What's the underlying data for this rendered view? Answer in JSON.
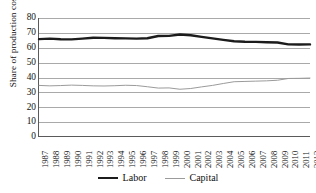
{
  "chart_data": {
    "type": "line",
    "title": "",
    "xlabel": "",
    "ylabel": "Share of production costs (%)",
    "ylim": [
      0,
      80
    ],
    "ytick_step": 10,
    "yticks": [
      80,
      70,
      60,
      50,
      40,
      30,
      20,
      10,
      0
    ],
    "grid": true,
    "legend_position": "bottom",
    "categories": [
      "1987",
      "1988",
      "1989",
      "1990",
      "1991",
      "1992",
      "1993",
      "1994",
      "1995",
      "1996",
      "1997",
      "1998",
      "1999",
      "2000",
      "2001",
      "2002",
      "2003",
      "2004",
      "2005",
      "2006",
      "2007",
      "2008",
      "2009",
      "2010",
      "2011",
      "2012"
    ],
    "series": [
      {
        "name": "Labor",
        "color": "#1c1c1c",
        "width": 2.4,
        "values": [
          65.7,
          66.0,
          65.6,
          65.5,
          66.0,
          66.6,
          66.5,
          66.3,
          66.2,
          66.0,
          66.3,
          67.8,
          67.9,
          68.8,
          68.3,
          67.2,
          66.2,
          65.2,
          64.2,
          63.9,
          63.8,
          63.6,
          63.4,
          62.1,
          62.0,
          62.1
        ]
      },
      {
        "name": "Capital",
        "color": "#9b9b9b",
        "width": 1.0,
        "values": [
          34.3,
          34.0,
          34.2,
          34.5,
          34.3,
          34.0,
          33.9,
          34.1,
          34.4,
          34.2,
          33.4,
          32.5,
          32.6,
          31.7,
          32.2,
          33.3,
          34.3,
          35.6,
          36.8,
          37.0,
          37.2,
          37.4,
          37.8,
          39.0,
          39.1,
          39.3
        ]
      }
    ]
  },
  "legend": {
    "items": [
      {
        "label": "Labor"
      },
      {
        "label": "Capital"
      }
    ]
  }
}
